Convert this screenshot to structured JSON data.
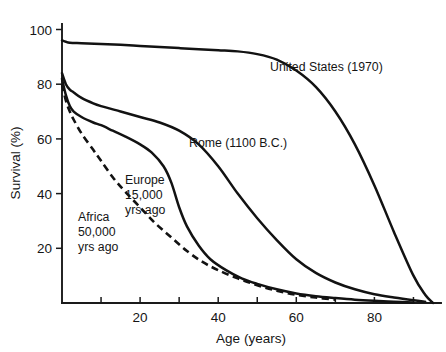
{
  "chart_data": {
    "type": "line",
    "title": "",
    "xlabel": "Age (years)",
    "ylabel": "Survival (%)",
    "xlim": [
      0,
      97
    ],
    "ylim": [
      0,
      104
    ],
    "grid": false,
    "legend_position": "inline-annotations",
    "xticks": [
      20,
      40,
      60,
      80
    ],
    "xticks_minor": [
      10,
      30,
      50,
      70,
      90
    ],
    "yticks": [
      20,
      40,
      60,
      80,
      100
    ],
    "xtick_labels": [
      "20",
      "40",
      "60",
      "80"
    ],
    "ytick_labels": [
      "20",
      "40",
      "60",
      "80",
      "100"
    ],
    "series": [
      {
        "name": "United States (1970)",
        "style": "solid",
        "label_x": 60,
        "label_y": 87,
        "x": [
          0,
          1,
          2,
          5,
          10,
          15,
          20,
          25,
          30,
          35,
          40,
          45,
          50,
          55,
          60,
          65,
          70,
          75,
          80,
          85,
          90,
          93,
          95
        ],
        "y": [
          96,
          95.5,
          95.2,
          95,
          94.7,
          94.4,
          94,
          93.6,
          93.2,
          92.8,
          92.4,
          92,
          91,
          89,
          85,
          79,
          70,
          58,
          43,
          26,
          10,
          3,
          0
        ]
      },
      {
        "name": "Rome (1100 B.C.)",
        "style": "solid",
        "label_x": 33,
        "label_y": 60,
        "x": [
          0,
          1,
          2,
          3,
          5,
          8,
          10,
          15,
          20,
          25,
          30,
          35,
          40,
          45,
          50,
          55,
          60,
          65,
          70,
          75,
          80,
          85,
          90,
          93
        ],
        "y": [
          84,
          80,
          78,
          77,
          75,
          73,
          72,
          70,
          68,
          66,
          63,
          58,
          50,
          40,
          31,
          23,
          16,
          11,
          7.5,
          5,
          3.2,
          2,
          1,
          0.5
        ]
      },
      {
        "name": "Europe 15,000 yrs ago",
        "style": "solid",
        "label_x": 22,
        "label_y": 46,
        "x": [
          0,
          1,
          2,
          3,
          5,
          8,
          10,
          13,
          16,
          20,
          23,
          26,
          28,
          30,
          32,
          35,
          38,
          42,
          46,
          50,
          55,
          60,
          65,
          70,
          75,
          80,
          85,
          90
        ],
        "y": [
          82,
          76,
          72,
          70,
          68,
          66,
          65,
          63,
          61,
          58,
          55,
          50,
          44,
          35,
          28,
          21,
          16,
          12,
          9,
          7,
          5,
          3.5,
          2.5,
          1.8,
          1.2,
          0.8,
          0.5,
          0.2
        ]
      },
      {
        "name": "Africa 50,000 yrs ago",
        "style": "dashed",
        "label_x": 11,
        "label_y": 36,
        "x": [
          0,
          1,
          2,
          3,
          5,
          8,
          10,
          13,
          16,
          20,
          24,
          28,
          32,
          36,
          40,
          45,
          50,
          55,
          60,
          65,
          70
        ],
        "y": [
          80,
          74,
          70,
          67,
          62,
          56,
          52,
          46,
          41,
          35,
          29,
          24,
          19,
          15,
          12,
          9,
          6.5,
          4.5,
          3,
          2,
          1.2
        ]
      }
    ],
    "annotations": [
      {
        "name": "united-states",
        "lines": [
          "United States (1970)"
        ],
        "x_px": 270,
        "y_px": 71
      },
      {
        "name": "rome",
        "lines": [
          "Rome (1100 B.C.)"
        ],
        "x_px": 189,
        "y_px": 147
      },
      {
        "name": "europe",
        "lines": [
          "Europe",
          "15,000",
          "yrs ago"
        ],
        "x_px": 125,
        "y_px": 184
      },
      {
        "name": "africa",
        "lines": [
          "Africa",
          "50,000",
          "yrs ago"
        ],
        "x_px": 78,
        "y_px": 221
      }
    ]
  }
}
